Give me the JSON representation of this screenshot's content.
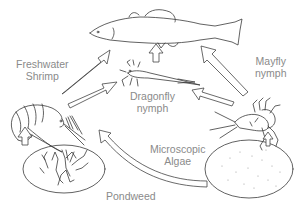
{
  "diagram": {
    "type": "food-web",
    "colors": {
      "label": "#8a8a8a",
      "ink": "#3a3a3a",
      "background": "#ffffff"
    },
    "nodes": [
      {
        "id": "fish",
        "label": ""
      },
      {
        "id": "freshwater_shrimp",
        "label_line1": "Freshwater",
        "label_line2": "Shrimp"
      },
      {
        "id": "dragonfly_nymph",
        "label_line1": "Dragonfly",
        "label_line2": "nymph"
      },
      {
        "id": "mayfly_nymph",
        "label_line1": "Mayfly",
        "label_line2": "nymph"
      },
      {
        "id": "microscopic_algae",
        "label_line1": "Microscopic",
        "label_line2": "Algae"
      },
      {
        "id": "pondweed",
        "label_line1": "Pondweed"
      }
    ],
    "edges": [
      {
        "from": "freshwater_shrimp",
        "to": "fish"
      },
      {
        "from": "freshwater_shrimp",
        "to": "dragonfly_nymph"
      },
      {
        "from": "dragonfly_nymph",
        "to": "fish"
      },
      {
        "from": "mayfly_nymph",
        "to": "fish"
      },
      {
        "from": "mayfly_nymph",
        "to": "dragonfly_nymph"
      },
      {
        "from": "pondweed",
        "to": "freshwater_shrimp"
      },
      {
        "from": "microscopic_algae",
        "to": "freshwater_shrimp"
      },
      {
        "from": "microscopic_algae",
        "to": "mayfly_nymph"
      }
    ]
  }
}
